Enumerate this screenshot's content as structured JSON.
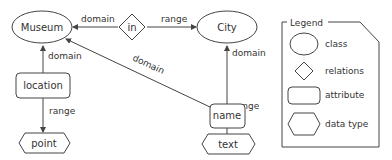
{
  "diagram": {
    "nodes": {
      "museum": {
        "label": "Museum",
        "type": "class"
      },
      "in": {
        "label": "in",
        "type": "relations"
      },
      "city": {
        "label": "City",
        "type": "class"
      },
      "location": {
        "label": "location",
        "type": "attribute"
      },
      "name": {
        "label": "name",
        "type": "attribute"
      },
      "point": {
        "label": "point",
        "type": "data type"
      },
      "text": {
        "label": "text",
        "type": "data type"
      }
    },
    "edges": {
      "in_museum": {
        "from": "in",
        "to": "Museum",
        "label": "domain"
      },
      "in_city": {
        "from": "in",
        "to": "City",
        "label": "range"
      },
      "location_museum": {
        "from": "location",
        "to": "Museum",
        "label": "domain"
      },
      "name_museum": {
        "from": "name",
        "to": "Museum",
        "label": "domain"
      },
      "name_city": {
        "from": "name",
        "to": "City",
        "label": "domain"
      },
      "location_point": {
        "from": "location",
        "to": "point",
        "label": "range"
      },
      "name_text": {
        "from": "name",
        "to": "text",
        "label": "range"
      }
    }
  },
  "legend": {
    "title": "Legend",
    "items": [
      {
        "shape": "ellipse",
        "label": "class"
      },
      {
        "shape": "diamond",
        "label": "relations"
      },
      {
        "shape": "rounded-rect",
        "label": "attribute"
      },
      {
        "shape": "hexagon",
        "label": "data type"
      }
    ]
  }
}
